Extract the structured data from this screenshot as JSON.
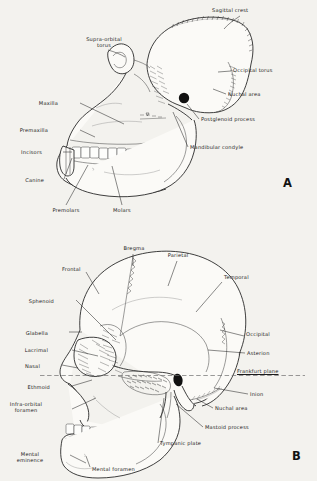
{
  "plate": {
    "background_color": "#f3f2ee",
    "ink_color": "#1b1b1b",
    "width": 317,
    "height": 481
  },
  "figures": [
    {
      "id": "figure-a",
      "letter": "A",
      "subject": "ape-skull-lateral-view",
      "labels": [
        {
          "id": "sagittal-crest",
          "text": "Sagittal crest",
          "x": 212,
          "y": 11,
          "align": "left"
        },
        {
          "id": "supra-orbital-torus",
          "text": "Supra-orbital\ntorus",
          "x": 104,
          "y": 42,
          "align": "right"
        },
        {
          "id": "occipital-torus",
          "text": "Occipital torus",
          "x": 233,
          "y": 70,
          "align": "left"
        },
        {
          "id": "nuchal-area",
          "text": "Nuchal area",
          "x": 228,
          "y": 95,
          "align": "left"
        },
        {
          "id": "postglenoid-process",
          "text": "Postglenoid process",
          "x": 201,
          "y": 120,
          "align": "left"
        },
        {
          "id": "mandibular-condyle",
          "text": "Mandibular condyle",
          "x": 190,
          "y": 148,
          "align": "left"
        },
        {
          "id": "maxilla",
          "text": "Maxilla",
          "x": 58,
          "y": 104,
          "align": "right"
        },
        {
          "id": "premaxilla",
          "text": "Premaxilla",
          "x": 48,
          "y": 131,
          "align": "right"
        },
        {
          "id": "incisors",
          "text": "Incisors",
          "x": 42,
          "y": 153,
          "align": "right"
        },
        {
          "id": "canine",
          "text": "Canine",
          "x": 44,
          "y": 181,
          "align": "right"
        },
        {
          "id": "premolars",
          "text": "Premolars",
          "x": 66,
          "y": 211,
          "align": "center"
        },
        {
          "id": "molars",
          "text": "Molars",
          "x": 122,
          "y": 211,
          "align": "center"
        }
      ]
    },
    {
      "id": "figure-b",
      "letter": "B",
      "subject": "human-skull-lateral-view",
      "plane_label": "Frankfurt plane",
      "labels": [
        {
          "id": "bregma",
          "text": "Bregma",
          "x": 133,
          "y": 249,
          "align": "center"
        },
        {
          "id": "parietal",
          "text": "Parietal",
          "x": 177,
          "y": 256,
          "align": "center"
        },
        {
          "id": "frontal",
          "text": "Frontal",
          "x": 62,
          "y": 270,
          "align": "left"
        },
        {
          "id": "temporal",
          "text": "Temporal",
          "x": 224,
          "y": 278,
          "align": "left"
        },
        {
          "id": "sphenoid",
          "text": "Sphenoid",
          "x": 54,
          "y": 302,
          "align": "right"
        },
        {
          "id": "occipital",
          "text": "Occipital",
          "x": 246,
          "y": 335,
          "align": "left"
        },
        {
          "id": "glabella",
          "text": "Glabella",
          "x": 48,
          "y": 334,
          "align": "right"
        },
        {
          "id": "lacrimal",
          "text": "Lacrimal",
          "x": 48,
          "y": 351,
          "align": "right"
        },
        {
          "id": "asterion",
          "text": "Asterion",
          "x": 247,
          "y": 354,
          "align": "left"
        },
        {
          "id": "nasal",
          "text": "Nasal",
          "x": 40,
          "y": 367,
          "align": "right"
        },
        {
          "id": "frankfurt-plane",
          "text": "Frankfurt plane",
          "x": 237,
          "y": 372,
          "align": "left"
        },
        {
          "id": "ethmoid",
          "text": "Ethmoid",
          "x": 50,
          "y": 388,
          "align": "right"
        },
        {
          "id": "inion",
          "text": "Inion",
          "x": 250,
          "y": 395,
          "align": "left"
        },
        {
          "id": "nuchal-area-b",
          "text": "Nuchal area",
          "x": 215,
          "y": 409,
          "align": "left"
        },
        {
          "id": "infra-orbital-foramen",
          "text": "Infra-orbital\nforamen",
          "x": 50,
          "y": 407,
          "align": "right"
        },
        {
          "id": "mastoid-process",
          "text": "Mastoid process",
          "x": 205,
          "y": 428,
          "align": "left"
        },
        {
          "id": "tympanic-plate",
          "text": "Tympanic plate",
          "x": 160,
          "y": 444,
          "align": "left"
        },
        {
          "id": "mental-eminence",
          "text": "Mental\neminence",
          "x": 48,
          "y": 457,
          "align": "right"
        },
        {
          "id": "mental-foramen",
          "text": "Mental foramen",
          "x": 92,
          "y": 470,
          "align": "left"
        }
      ]
    }
  ]
}
